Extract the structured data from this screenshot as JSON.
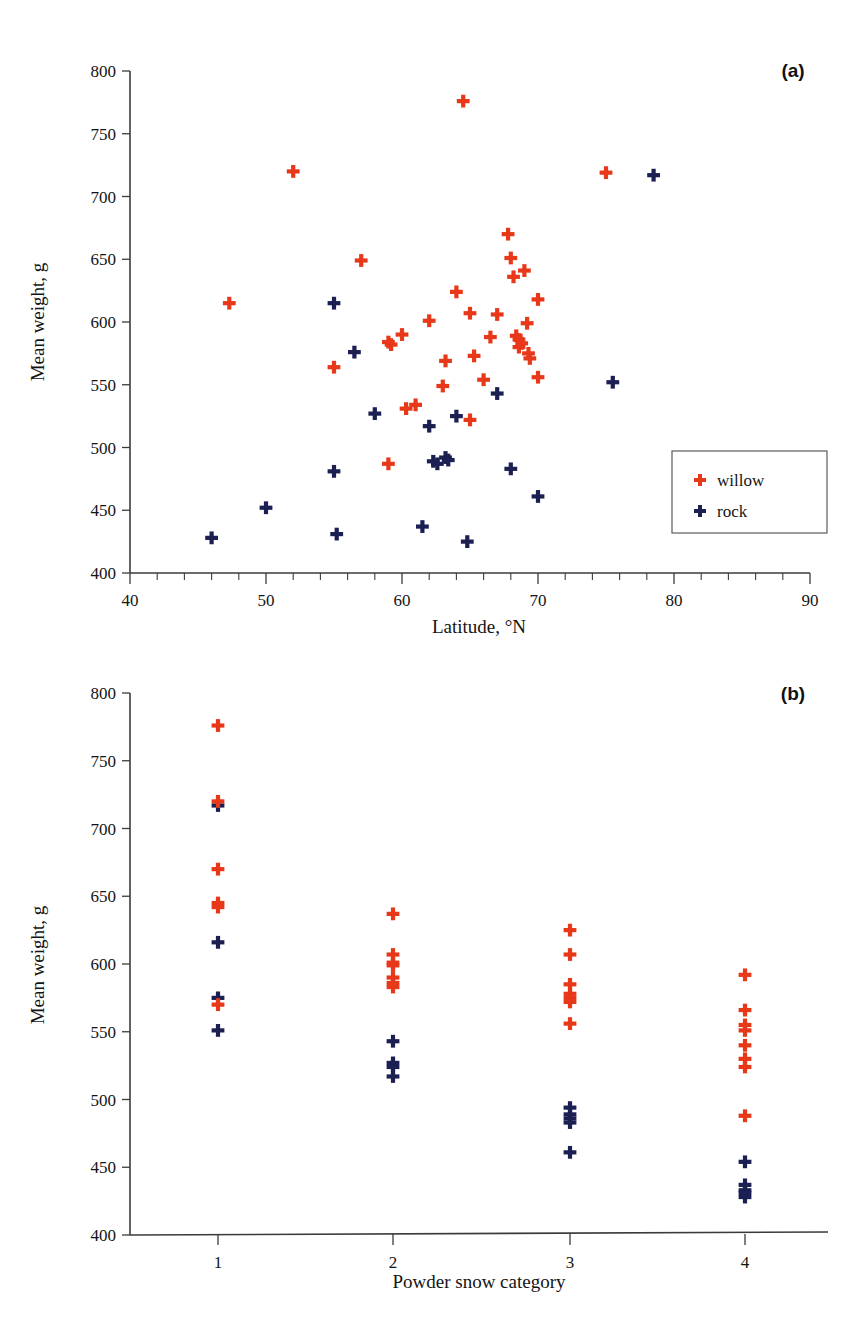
{
  "figure": {
    "background": "#ffffff",
    "colors": {
      "willow": "#e8381a",
      "rock": "#1b1f52",
      "axis": "#3b3b3b",
      "text": "#141414"
    }
  },
  "panel_a": {
    "label": "(a)",
    "legend": {
      "position": "bottom-right-inside",
      "entries": [
        {
          "name": "willow",
          "label": "willow",
          "color": "#e8381a",
          "marker": "plus-icon"
        },
        {
          "name": "rock",
          "label": "rock",
          "color": "#1b1f52",
          "marker": "plus-icon"
        }
      ]
    }
  },
  "panel_b": {
    "label": "(b)"
  },
  "chart_data": [
    {
      "type": "scatter",
      "panel": "(a)",
      "title": "",
      "xlabel": "Latitude, °N",
      "ylabel": "Mean weight, g",
      "xlim": [
        40,
        90
      ],
      "ylim": [
        400,
        800
      ],
      "xticks": [
        40,
        50,
        60,
        70,
        80,
        90
      ],
      "yticks": [
        400,
        450,
        500,
        550,
        600,
        650,
        700,
        750,
        800
      ],
      "x_minor_tick_step": 2,
      "grid": false,
      "legend": [
        "willow",
        "rock"
      ],
      "legend_position": "lower right",
      "marker": "plus",
      "series": [
        {
          "name": "willow",
          "color": "#e8381a",
          "points": [
            [
              47.3,
              615
            ],
            [
              52.0,
              720
            ],
            [
              55.0,
              564
            ],
            [
              57.0,
              649
            ],
            [
              59.0,
              584
            ],
            [
              59.2,
              582
            ],
            [
              59.0,
              487
            ],
            [
              60.0,
              590
            ],
            [
              60.3,
              531
            ],
            [
              61.0,
              534
            ],
            [
              62.0,
              601
            ],
            [
              63.0,
              549
            ],
            [
              63.2,
              569
            ],
            [
              64.0,
              624
            ],
            [
              64.5,
              776
            ],
            [
              65.0,
              607
            ],
            [
              65.3,
              573
            ],
            [
              65.0,
              522
            ],
            [
              66.0,
              554
            ],
            [
              66.5,
              588
            ],
            [
              67.0,
              606
            ],
            [
              67.8,
              670
            ],
            [
              68.0,
              651
            ],
            [
              68.2,
              636
            ],
            [
              68.4,
              589
            ],
            [
              68.6,
              586
            ],
            [
              68.8,
              583
            ],
            [
              68.6,
              580
            ],
            [
              69.0,
              641
            ],
            [
              69.2,
              599
            ],
            [
              69.3,
              575
            ],
            [
              69.4,
              571
            ],
            [
              70.0,
              618
            ],
            [
              70.0,
              556
            ],
            [
              75.0,
              719
            ]
          ]
        },
        {
          "name": "rock",
          "color": "#1b1f52",
          "points": [
            [
              46.0,
              428
            ],
            [
              50.0,
              452
            ],
            [
              55.0,
              481
            ],
            [
              55.0,
              615
            ],
            [
              55.2,
              431
            ],
            [
              56.5,
              576
            ],
            [
              58.0,
              527
            ],
            [
              61.5,
              437
            ],
            [
              62.0,
              517
            ],
            [
              62.3,
              489
            ],
            [
              62.6,
              487
            ],
            [
              63.2,
              492
            ],
            [
              63.4,
              490
            ],
            [
              64.0,
              525
            ],
            [
              64.8,
              425
            ],
            [
              67.0,
              543
            ],
            [
              68.0,
              483
            ],
            [
              70.0,
              461
            ],
            [
              75.5,
              552
            ],
            [
              78.5,
              717
            ]
          ]
        }
      ]
    },
    {
      "type": "scatter",
      "panel": "(b)",
      "title": "",
      "xlabel": "Powder snow category",
      "ylabel": "Mean weight, g",
      "xlim": [
        0.5,
        4.5
      ],
      "ylim": [
        400,
        800
      ],
      "xticks": [
        1,
        2,
        3,
        4
      ],
      "xticklabels": [
        "1",
        "2",
        "3",
        "4"
      ],
      "yticks": [
        400,
        450,
        500,
        550,
        600,
        650,
        700,
        750,
        800
      ],
      "grid": false,
      "marker": "plus",
      "series": [
        {
          "name": "willow",
          "color": "#e8381a",
          "points": [
            [
              1,
              776
            ],
            [
              1,
              720
            ],
            [
              1,
              670
            ],
            [
              1,
              645
            ],
            [
              1,
              642
            ],
            [
              1,
              570
            ],
            [
              2,
              637
            ],
            [
              2,
              607
            ],
            [
              2,
              601
            ],
            [
              2,
              599
            ],
            [
              2,
              590
            ],
            [
              2,
              586
            ],
            [
              2,
              583
            ],
            [
              3,
              625
            ],
            [
              3,
              607
            ],
            [
              3,
              585
            ],
            [
              3,
              578
            ],
            [
              3,
              575
            ],
            [
              3,
              572
            ],
            [
              3,
              556
            ],
            [
              4,
              592
            ],
            [
              4,
              566
            ],
            [
              4,
              555
            ],
            [
              4,
              551
            ],
            [
              4,
              540
            ],
            [
              4,
              530
            ],
            [
              4,
              524
            ],
            [
              4,
              488
            ]
          ]
        },
        {
          "name": "rock",
          "color": "#1b1f52",
          "points": [
            [
              1,
              717
            ],
            [
              1,
              616
            ],
            [
              1,
              575
            ],
            [
              1,
              551
            ],
            [
              2,
              543
            ],
            [
              2,
              527
            ],
            [
              2,
              524
            ],
            [
              2,
              517
            ],
            [
              3,
              494
            ],
            [
              3,
              489
            ],
            [
              3,
              486
            ],
            [
              3,
              483
            ],
            [
              3,
              461
            ],
            [
              4,
              454
            ],
            [
              4,
              437
            ],
            [
              4,
              433
            ],
            [
              4,
              431
            ],
            [
              4,
              428
            ]
          ]
        }
      ]
    }
  ]
}
